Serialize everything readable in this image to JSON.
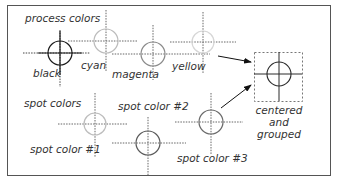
{
  "colors": {
    "frame": "#555555",
    "black": "#1a1a1a",
    "cyan": "#bbbbbb",
    "magenta": "#8a8a8a",
    "yellow": "#d6d6d6",
    "spot1": "#bdbdbd",
    "spot2": "#5a5a5a",
    "spot3": "#6a6a6a",
    "grouped": "#2a2a2a",
    "arrow": "#111111"
  },
  "groups": {
    "process": {
      "label": "process colors"
    },
    "spot": {
      "label": "spot colors"
    }
  },
  "marks": [
    {
      "id": "black",
      "label": "black",
      "color_key": "black"
    },
    {
      "id": "cyan",
      "label": "cyan",
      "color_key": "cyan"
    },
    {
      "id": "magenta",
      "label": "magenta",
      "color_key": "magenta"
    },
    {
      "id": "yellow",
      "label": "yellow",
      "color_key": "yellow"
    },
    {
      "id": "spot-1",
      "label": "spot color #1",
      "color_key": "spot1"
    },
    {
      "id": "spot-2",
      "label": "spot color #2",
      "color_key": "spot2"
    },
    {
      "id": "spot-3",
      "label": "spot color #3",
      "color_key": "spot3"
    }
  ],
  "result": {
    "label_lines": [
      "centered",
      "and",
      "grouped"
    ]
  }
}
